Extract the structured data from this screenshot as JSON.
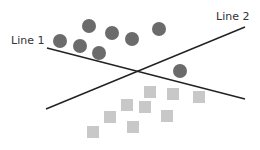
{
  "diagram": {
    "labels": {
      "line1": "Line 1",
      "line2": "Line 2"
    },
    "colors": {
      "circle": "#6b6b6b",
      "square": "#c8c8c8",
      "line": "#222222",
      "text": "#333333"
    },
    "classes": [
      {
        "name": "circles",
        "shape": "circle",
        "count": 8
      },
      {
        "name": "squares",
        "shape": "square",
        "count": 9
      }
    ]
  }
}
